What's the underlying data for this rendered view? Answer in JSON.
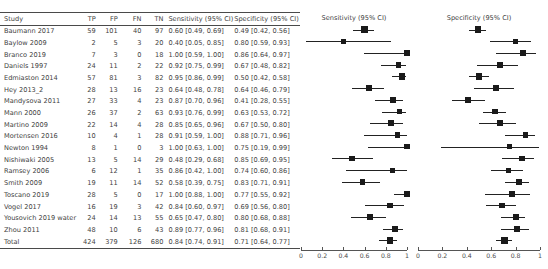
{
  "chart_data": {
    "type": "table",
    "title": "",
    "columns": [
      "Study",
      "TP",
      "FP",
      "FN",
      "TN",
      "Sensitivity (95% CI)",
      "Specificity (95% CI)"
    ],
    "axis": {
      "ticks": [
        0,
        0.2,
        0.4,
        0.6,
        0.8,
        1
      ],
      "tick_labels": [
        "0",
        "0.2",
        "0.4",
        "0.6",
        "0.8",
        "1"
      ],
      "xlim": [
        0,
        1
      ],
      "grid": false
    },
    "panels": [
      {
        "name": "sensitivity",
        "title": "Sensitivity (95% CI)"
      },
      {
        "name": "specificity",
        "title": "Specificity (95% CI)"
      }
    ],
    "rows": [
      {
        "study": "Baumann 2017",
        "tp": "59",
        "fp": "101",
        "fn": "40",
        "tn": "97",
        "sens_text": "0.60 [0.49, 0.69]",
        "spec_text": "0.49 [0.42, 0.56]",
        "sens": 0.6,
        "sens_lo": 0.49,
        "sens_hi": 0.69,
        "spec": 0.49,
        "spec_lo": 0.42,
        "spec_hi": 0.56,
        "weight": 1.0
      },
      {
        "study": "Baylow 2009",
        "tp": "2",
        "fp": "5",
        "fn": "3",
        "tn": "20",
        "sens_text": "0.40 [0.05, 0.85]",
        "spec_text": "0.80 [0.59, 0.93]",
        "sens": 0.4,
        "sens_lo": 0.05,
        "sens_hi": 0.85,
        "spec": 0.8,
        "spec_lo": 0.59,
        "spec_hi": 0.93,
        "weight": 0.62
      },
      {
        "study": "Branco 2019",
        "tp": "7",
        "fp": "3",
        "fn": "0",
        "tn": "18",
        "sens_text": "1.00 [0.59, 1.00]",
        "spec_text": "0.86 [0.64, 0.97]",
        "sens": 1.0,
        "sens_lo": 0.59,
        "sens_hi": 1.0,
        "spec": 0.86,
        "spec_lo": 0.64,
        "spec_hi": 0.97,
        "weight": 0.66
      },
      {
        "study": "Daniels 1997",
        "tp": "24",
        "fp": "11",
        "fn": "2",
        "tn": "22",
        "sens_text": "0.92 [0.75, 0.99]",
        "spec_text": "0.67 [0.48, 0.82]",
        "sens": 0.92,
        "sens_lo": 0.75,
        "sens_hi": 0.99,
        "spec": 0.67,
        "spec_lo": 0.48,
        "spec_hi": 0.82,
        "weight": 0.8
      },
      {
        "study": "Edmiaston 2014",
        "tp": "57",
        "fp": "81",
        "fn": "3",
        "tn": "82",
        "sens_text": "0.95 [0.86, 0.99]",
        "spec_text": "0.50 [0.42, 0.58]",
        "sens": 0.95,
        "sens_lo": 0.86,
        "sens_hi": 0.99,
        "spec": 0.5,
        "spec_lo": 0.42,
        "spec_hi": 0.58,
        "weight": 0.98
      },
      {
        "study": "Hey 2013_2",
        "tp": "28",
        "fp": "13",
        "fn": "16",
        "tn": "23",
        "sens_text": "0.64 [0.48, 0.78]",
        "spec_text": "0.64 [0.46, 0.79]",
        "sens": 0.64,
        "sens_lo": 0.48,
        "sens_hi": 0.78,
        "spec": 0.64,
        "spec_lo": 0.46,
        "spec_hi": 0.79,
        "weight": 0.84
      },
      {
        "study": "Mandysova 2011",
        "tp": "27",
        "fp": "33",
        "fn": "4",
        "tn": "23",
        "sens_text": "0.87 [0.70, 0.96]",
        "spec_text": "0.41 [0.28, 0.55]",
        "sens": 0.87,
        "sens_lo": 0.7,
        "sens_hi": 0.96,
        "spec": 0.41,
        "spec_lo": 0.28,
        "spec_hi": 0.55,
        "weight": 0.82
      },
      {
        "study": "Mann 2000",
        "tp": "26",
        "fp": "37",
        "fn": "2",
        "tn": "63",
        "sens_text": "0.93 [0.76, 0.99]",
        "spec_text": "0.63 [0.53, 0.72]",
        "sens": 0.93,
        "sens_lo": 0.76,
        "sens_hi": 0.99,
        "spec": 0.63,
        "spec_lo": 0.53,
        "spec_hi": 0.72,
        "weight": 0.82
      },
      {
        "study": "Martino 2009",
        "tp": "22",
        "fp": "14",
        "fn": "4",
        "tn": "28",
        "sens_text": "0.85 [0.65, 0.96]",
        "spec_text": "0.67 [0.50, 0.80]",
        "sens": 0.85,
        "sens_lo": 0.65,
        "sens_hi": 0.96,
        "spec": 0.67,
        "spec_lo": 0.5,
        "spec_hi": 0.8,
        "weight": 0.78
      },
      {
        "study": "Mortensen 2016",
        "tp": "10",
        "fp": "4",
        "fn": "1",
        "tn": "28",
        "sens_text": "0.91 [0.59, 1.00]",
        "spec_text": "0.88 [0.71, 0.96]",
        "sens": 0.91,
        "sens_lo": 0.59,
        "sens_hi": 1.0,
        "spec": 0.88,
        "spec_lo": 0.71,
        "spec_hi": 0.96,
        "weight": 0.7
      },
      {
        "study": "Newton 1994",
        "tp": "8",
        "fp": "1",
        "fn": "0",
        "tn": "3",
        "sens_text": "1.00 [0.63, 1.00]",
        "spec_text": "0.75 [0.19, 0.99]",
        "sens": 1.0,
        "sens_lo": 0.63,
        "sens_hi": 1.0,
        "spec": 0.75,
        "spec_lo": 0.19,
        "spec_hi": 0.99,
        "weight": 0.66
      },
      {
        "study": "Nishiwaki 2005",
        "tp": "13",
        "fp": "5",
        "fn": "14",
        "tn": "29",
        "sens_text": "0.48 [0.29, 0.68]",
        "spec_text": "0.85 [0.69, 0.95]",
        "sens": 0.48,
        "sens_lo": 0.29,
        "sens_hi": 0.68,
        "spec": 0.85,
        "spec_lo": 0.69,
        "spec_hi": 0.95,
        "weight": 0.78
      },
      {
        "study": "Ramsey 2006",
        "tp": "6",
        "fp": "12",
        "fn": "1",
        "tn": "35",
        "sens_text": "0.86 [0.42, 1.00]",
        "spec_text": "0.74 [0.60, 0.86]",
        "sens": 0.86,
        "sens_lo": 0.42,
        "sens_hi": 1.0,
        "spec": 0.74,
        "spec_lo": 0.6,
        "spec_hi": 0.86,
        "weight": 0.62
      },
      {
        "study": "Smith 2009",
        "tp": "19",
        "fp": "11",
        "fn": "14",
        "tn": "52",
        "sens_text": "0.58 [0.39, 0.75]",
        "spec_text": "0.83 [0.71, 0.91]",
        "sens": 0.58,
        "sens_lo": 0.39,
        "sens_hi": 0.75,
        "spec": 0.83,
        "spec_lo": 0.71,
        "spec_hi": 0.91,
        "weight": 0.82
      },
      {
        "study": "Toscano 2019",
        "tp": "28",
        "fp": "5",
        "fn": "0",
        "tn": "17",
        "sens_text": "1.00 [0.88, 1.00]",
        "spec_text": "0.77 [0.55, 0.92]",
        "sens": 1.0,
        "sens_lo": 0.88,
        "sens_hi": 1.0,
        "spec": 0.77,
        "spec_lo": 0.55,
        "spec_hi": 0.92,
        "weight": 0.84
      },
      {
        "study": "Vogel 2017",
        "tp": "16",
        "fp": "19",
        "fn": "3",
        "tn": "42",
        "sens_text": "0.84 [0.60, 0.97]",
        "spec_text": "0.69 [0.56, 0.80]",
        "sens": 0.84,
        "sens_lo": 0.6,
        "sens_hi": 0.97,
        "spec": 0.69,
        "spec_lo": 0.56,
        "spec_hi": 0.8,
        "weight": 0.74
      },
      {
        "study": "Yousovich 2019 water",
        "tp": "24",
        "fp": "14",
        "fn": "13",
        "tn": "55",
        "sens_text": "0.65 [0.47, 0.80]",
        "spec_text": "0.80 [0.68, 0.88]",
        "sens": 0.65,
        "sens_lo": 0.47,
        "sens_hi": 0.8,
        "spec": 0.8,
        "spec_lo": 0.68,
        "spec_hi": 0.88,
        "weight": 0.84
      },
      {
        "study": "Zhou 2011",
        "tp": "48",
        "fp": "10",
        "fn": "6",
        "tn": "43",
        "sens_text": "0.89 [0.77, 0.96]",
        "spec_text": "0.81 [0.68, 0.91]",
        "sens": 0.89,
        "sens_lo": 0.77,
        "sens_hi": 0.96,
        "spec": 0.81,
        "spec_lo": 0.68,
        "spec_hi": 0.91,
        "weight": 0.92
      },
      {
        "study": "Total",
        "tp": "424",
        "fp": "379",
        "fn": "126",
        "tn": "680",
        "sens_text": "0.84 [0.74, 0.91]",
        "spec_text": "0.71 [0.64, 0.77]",
        "sens": 0.84,
        "sens_lo": 0.74,
        "sens_hi": 0.91,
        "spec": 0.71,
        "spec_lo": 0.64,
        "spec_hi": 0.77,
        "weight": 1.0,
        "is_total": true
      }
    ]
  },
  "colors": {
    "marker": "#1a1a1a",
    "line": "#222222",
    "rule": "#4a4a4a",
    "text": "#3f3f3f"
  }
}
